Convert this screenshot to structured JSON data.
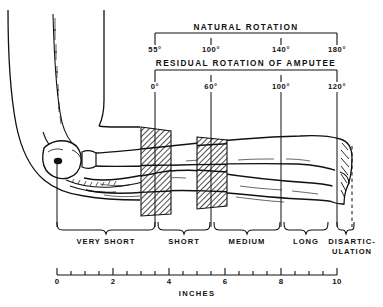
{
  "figure": {
    "title_natural": "NATURAL ROTATION",
    "title_residual": "RESIDUAL ROTATION OF AMPUTEE",
    "axis_label": "INCHES"
  },
  "natural_rotation": {
    "label": "NATURAL ROTATION",
    "ticks": [
      {
        "value": "55°",
        "inches": 3.5
      },
      {
        "value": "100°",
        "inches": 5.5
      },
      {
        "value": "140°",
        "inches": 8.0
      },
      {
        "value": "180°",
        "inches": 10.0
      }
    ]
  },
  "residual_rotation": {
    "label": "RESIDUAL ROTATION OF AMPUTEE",
    "ticks": [
      {
        "value": "0°",
        "inches": 3.5
      },
      {
        "value": "60°",
        "inches": 5.5
      },
      {
        "value": "100°",
        "inches": 8.0
      },
      {
        "value": "120°",
        "inches": 10.0
      }
    ]
  },
  "segments": [
    {
      "label": "VERY SHORT",
      "start_in": 0.0,
      "end_in": 3.5
    },
    {
      "label": "SHORT",
      "start_in": 3.5,
      "end_in": 5.5
    },
    {
      "label": "MEDIUM",
      "start_in": 5.5,
      "end_in": 8.0
    },
    {
      "label": "LONG",
      "start_in": 8.0,
      "end_in": 10.0
    },
    {
      "label": "DISARTIC-",
      "label2": "ULATION",
      "start_in": 10.0,
      "end_in": 10.55
    }
  ],
  "ruler": {
    "label": "INCHES",
    "min": 0,
    "max": 10,
    "major_step": 2,
    "minor_step": 0.5,
    "tick_labels": [
      "0",
      "2",
      "4",
      "6",
      "8",
      "10"
    ]
  },
  "hatched_bands": [
    {
      "name": "band-one",
      "start_in": 3.0,
      "end_in": 4.05
    },
    {
      "name": "band-two",
      "start_in": 5.0,
      "end_in": 6.05
    }
  ],
  "colors": {
    "ink": "#111111",
    "paper": "#ffffff",
    "hatch": "#1a1a1a"
  }
}
